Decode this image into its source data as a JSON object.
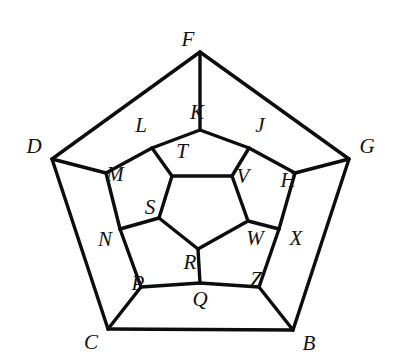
{
  "figure": {
    "name": "dodecahedron-schlegel-diagram",
    "background_color": "#ffffff",
    "edge_color": "#0d0d0d",
    "label_color": "#111111",
    "edge_width": 3.4
  },
  "vertices": [
    {
      "id": "F",
      "label": "F",
      "ring": "outer",
      "x": 200,
      "y": 52,
      "label_x": 188,
      "label_y": 41
    },
    {
      "id": "D",
      "label": "D",
      "ring": "outer",
      "x": 52,
      "y": 159,
      "label_x": 34,
      "label_y": 148
    },
    {
      "id": "G",
      "label": "G",
      "ring": "outer",
      "x": 349,
      "y": 159,
      "label_x": 367,
      "label_y": 148
    },
    {
      "id": "C",
      "label": "C",
      "ring": "outer",
      "x": 108,
      "y": 329,
      "label_x": 91,
      "label_y": 344
    },
    {
      "id": "B",
      "label": "B",
      "ring": "outer",
      "x": 293,
      "y": 330,
      "label_x": 309,
      "label_y": 345
    },
    {
      "id": "K",
      "label": "K",
      "ring": "middle",
      "x": 200,
      "y": 130,
      "label_x": 197,
      "label_y": 114
    },
    {
      "id": "L",
      "label": "L",
      "ring": "middle",
      "x": 152,
      "y": 148,
      "label_x": 141,
      "label_y": 127
    },
    {
      "id": "J",
      "label": "J",
      "ring": "middle",
      "x": 249,
      "y": 148,
      "label_x": 260,
      "label_y": 127
    },
    {
      "id": "M",
      "label": "M",
      "ring": "middle",
      "x": 106,
      "y": 173,
      "label_x": 115,
      "label_y": 176
    },
    {
      "id": "H",
      "label": "H",
      "ring": "middle",
      "x": 295,
      "y": 173,
      "label_x": 288,
      "label_y": 182
    },
    {
      "id": "N",
      "label": "N",
      "ring": "middle",
      "x": 120,
      "y": 229,
      "label_x": 105,
      "label_y": 241
    },
    {
      "id": "X",
      "label": "X",
      "ring": "middle",
      "x": 279,
      "y": 229,
      "label_x": 296,
      "label_y": 240
    },
    {
      "id": "P",
      "label": "P",
      "ring": "middle",
      "x": 141,
      "y": 287,
      "label_x": 138,
      "label_y": 285
    },
    {
      "id": "Z",
      "label": "Z",
      "ring": "middle",
      "x": 259,
      "y": 287,
      "label_x": 256,
      "label_y": 281
    },
    {
      "id": "Q",
      "label": "Q",
      "ring": "middle",
      "x": 200,
      "y": 283,
      "label_x": 200,
      "label_y": 301
    },
    {
      "id": "T",
      "label": "T",
      "ring": "inner",
      "x": 172,
      "y": 176,
      "label_x": 182,
      "label_y": 153
    },
    {
      "id": "V",
      "label": "V",
      "ring": "inner",
      "x": 232,
      "y": 176,
      "label_x": 243,
      "label_y": 178
    },
    {
      "id": "S",
      "label": "S",
      "ring": "inner",
      "x": 159,
      "y": 218,
      "label_x": 150,
      "label_y": 209
    },
    {
      "id": "W",
      "label": "W",
      "ring": "inner",
      "x": 248,
      "y": 221,
      "label_x": 255,
      "label_y": 240
    },
    {
      "id": "R",
      "label": "R",
      "ring": "inner",
      "x": 198,
      "y": 249,
      "label_x": 190,
      "label_y": 264
    }
  ],
  "edges": [
    {
      "from": "F",
      "to": "D",
      "kind": "outer-pentagon"
    },
    {
      "from": "D",
      "to": "C",
      "kind": "outer-pentagon"
    },
    {
      "from": "C",
      "to": "B",
      "kind": "outer-pentagon"
    },
    {
      "from": "B",
      "to": "G",
      "kind": "outer-pentagon"
    },
    {
      "from": "G",
      "to": "F",
      "kind": "outer-pentagon"
    },
    {
      "from": "F",
      "to": "K",
      "kind": "spoke-outer"
    },
    {
      "from": "D",
      "to": "M",
      "kind": "spoke-outer"
    },
    {
      "from": "C",
      "to": "P",
      "kind": "spoke-outer"
    },
    {
      "from": "B",
      "to": "Z",
      "kind": "spoke-outer"
    },
    {
      "from": "G",
      "to": "H",
      "kind": "spoke-outer"
    },
    {
      "from": "K",
      "to": "L",
      "kind": "middle-ring"
    },
    {
      "from": "L",
      "to": "M",
      "kind": "middle-ring"
    },
    {
      "from": "M",
      "to": "N",
      "kind": "middle-ring"
    },
    {
      "from": "N",
      "to": "P",
      "kind": "middle-ring"
    },
    {
      "from": "P",
      "to": "Q",
      "kind": "middle-ring"
    },
    {
      "from": "Q",
      "to": "Z",
      "kind": "middle-ring"
    },
    {
      "from": "Z",
      "to": "X",
      "kind": "middle-ring"
    },
    {
      "from": "X",
      "to": "H",
      "kind": "middle-ring"
    },
    {
      "from": "H",
      "to": "J",
      "kind": "middle-ring"
    },
    {
      "from": "J",
      "to": "K",
      "kind": "middle-ring"
    },
    {
      "from": "L",
      "to": "T",
      "kind": "spoke-inner"
    },
    {
      "from": "N",
      "to": "S",
      "kind": "spoke-inner"
    },
    {
      "from": "Q",
      "to": "R",
      "kind": "spoke-inner"
    },
    {
      "from": "X",
      "to": "W",
      "kind": "spoke-inner"
    },
    {
      "from": "J",
      "to": "V",
      "kind": "spoke-inner"
    },
    {
      "from": "T",
      "to": "V",
      "kind": "inner-pentagon"
    },
    {
      "from": "V",
      "to": "W",
      "kind": "inner-pentagon"
    },
    {
      "from": "W",
      "to": "R",
      "kind": "inner-pentagon"
    },
    {
      "from": "R",
      "to": "S",
      "kind": "inner-pentagon"
    },
    {
      "from": "S",
      "to": "T",
      "kind": "inner-pentagon"
    }
  ]
}
